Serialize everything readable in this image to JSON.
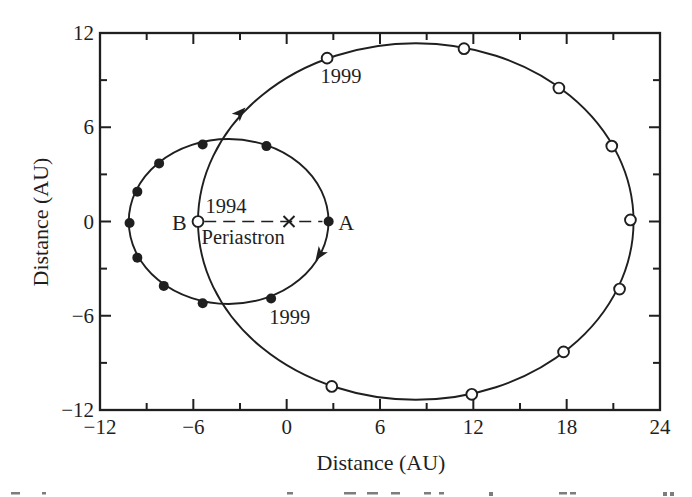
{
  "figure": {
    "kind": "binary-star-orbit-diagram"
  },
  "chart_data": {
    "type": "scatter",
    "subtype": "two-elliptical-orbits-about-center-of-mass",
    "title": "",
    "xlabel": "Distance (AU)",
    "ylabel": "Distance (AU)",
    "xlim": [
      -12,
      24
    ],
    "ylim": [
      -12,
      12
    ],
    "grid": false,
    "ink_color": "#1f1f1f",
    "x_ticks": {
      "values": [
        -12,
        -6,
        0,
        6,
        12,
        18,
        24
      ],
      "labels": [
        "−12",
        "−6",
        "0",
        "6",
        "12",
        "18",
        "24"
      ],
      "minor_step": 3
    },
    "y_ticks": {
      "values": [
        -12,
        -6,
        0,
        6,
        12
      ],
      "labels": [
        "−12",
        "−6",
        "0",
        "6",
        "12"
      ],
      "minor_step": 3
    },
    "series": [
      {
        "name": "star A orbit",
        "marker": "filled-circle",
        "ellipse_au": {
          "cx": -3.73,
          "cy": 0,
          "rx": 6.42,
          "ry": 5.25
        },
        "points_au": [
          [
            2.7,
            0.0
          ],
          [
            -1.0,
            -4.9
          ],
          [
            -5.4,
            -5.2
          ],
          [
            -7.9,
            -4.1
          ],
          [
            -9.6,
            -2.3
          ],
          [
            -10.1,
            -0.1
          ],
          [
            -9.6,
            1.9
          ],
          [
            -8.2,
            3.7
          ],
          [
            -5.4,
            4.9
          ],
          [
            -1.3,
            4.8
          ]
        ]
      },
      {
        "name": "star B orbit",
        "marker": "open-circle",
        "ellipse_au": {
          "cx": 8.3,
          "cy": 0,
          "rx": 14.0,
          "ry": 11.35
        },
        "points_au": [
          [
            -5.7,
            0.0
          ],
          [
            2.6,
            10.4
          ],
          [
            11.4,
            11.0
          ],
          [
            17.5,
            8.5
          ],
          [
            20.9,
            4.8
          ],
          [
            22.1,
            0.1
          ],
          [
            21.4,
            -4.3
          ],
          [
            17.8,
            -8.3
          ],
          [
            11.9,
            -11.0
          ],
          [
            2.9,
            -10.5
          ]
        ]
      }
    ],
    "center_of_mass_au": [
      0.15,
      0
    ],
    "separation_line_au": {
      "from": [
        -5.3,
        0
      ],
      "to": [
        2.3,
        0
      ],
      "style": "dashed"
    },
    "arrows": [
      {
        "orbit": "star B orbit",
        "tip_au": [
          -2.65,
          7.25
        ],
        "angle_deg": -46
      },
      {
        "orbit": "star A orbit",
        "tip_au": [
          1.85,
          -2.5
        ],
        "angle_deg": 124
      }
    ],
    "annotations": [
      {
        "name": "label-1999-orbit-B",
        "text": "1999",
        "at_au": [
          3.5,
          9.3
        ],
        "anchor": "middle",
        "size": 20.5
      },
      {
        "name": "label-1994",
        "text": "1994",
        "at_au": [
          -3.9,
          0.97
        ],
        "anchor": "middle",
        "size": 20.5
      },
      {
        "name": "label-periastron",
        "text": "Periastron",
        "at_au": [
          -2.8,
          -0.99
        ],
        "anchor": "middle",
        "size": 20.5
      },
      {
        "name": "label-star-B",
        "text": "B",
        "at_au": [
          -6.9,
          -0.05
        ],
        "anchor": "middle",
        "size": 22
      },
      {
        "name": "label-star-A",
        "text": "A",
        "at_au": [
          3.82,
          -0.05
        ],
        "anchor": "middle",
        "size": 22
      },
      {
        "name": "label-1999-orbit-A",
        "text": "1999",
        "at_au": [
          0.2,
          -6.05
        ],
        "anchor": "middle",
        "size": 20.5
      }
    ],
    "bottom_caption_fragments": [
      {
        "x": 11,
        "w": 9
      },
      {
        "x": 42,
        "w": 4
      },
      {
        "x": 287,
        "w": 6
      },
      {
        "x": 344,
        "w": 12
      },
      {
        "x": 367,
        "w": 11
      },
      {
        "x": 391,
        "w": 9
      },
      {
        "x": 424,
        "w": 7
      },
      {
        "x": 439,
        "w": 5
      },
      {
        "x": 489,
        "w": 4,
        "h": 4
      },
      {
        "x": 559,
        "w": 8
      },
      {
        "x": 570,
        "w": 6
      },
      {
        "x": 663,
        "w": 4,
        "h": 4
      },
      {
        "x": 670,
        "w": 4,
        "h": 4
      }
    ]
  }
}
